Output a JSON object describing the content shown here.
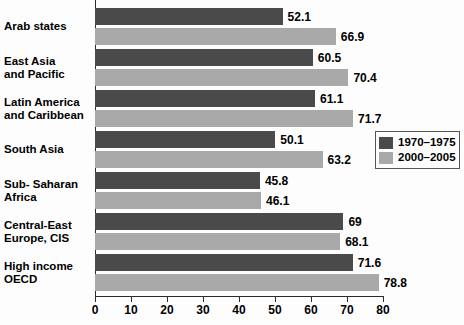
{
  "chart_data": {
    "type": "bar",
    "orientation": "horizontal",
    "title": "",
    "subtitle": "",
    "xlabel": "",
    "ylabel": "",
    "xlim": [
      0,
      80
    ],
    "xticks": [
      0,
      10,
      20,
      30,
      40,
      50,
      60,
      70,
      80
    ],
    "xtick_labels": [
      "0",
      "10",
      "20",
      "30",
      "40",
      "50",
      "60",
      "70",
      "80"
    ],
    "grid": false,
    "legend_position": "right-middle",
    "categories": [
      "Arab states",
      "East Asia\nand Pacific",
      "Latin America\nand Caribbean",
      "South Asia",
      "Sub- Saharan\nAfrica",
      "Central-East\nEurope, CIS",
      "High income\nOECD"
    ],
    "series": [
      {
        "name": "1970–1975",
        "color": "#4a4a4a",
        "values": [
          52.1,
          60.5,
          61.1,
          50.1,
          45.8,
          69,
          71.6
        ],
        "value_labels": [
          "52.1",
          "60.5",
          "61.1",
          "50.1",
          "45.8",
          "69",
          "71.6"
        ]
      },
      {
        "name": "2000–2005",
        "color": "#a9a9a9",
        "values": [
          66.9,
          70.4,
          71.7,
          63.2,
          46.1,
          68.1,
          78.8
        ],
        "value_labels": [
          "66.9",
          "70.4",
          "71.7",
          "63.2",
          "46.1",
          "68.1",
          "78.8"
        ]
      }
    ]
  },
  "legend": {
    "items": [
      {
        "label": "1970–1975",
        "color": "#4a4a4a"
      },
      {
        "label": "2000–2005",
        "color": "#a9a9a9"
      }
    ]
  }
}
